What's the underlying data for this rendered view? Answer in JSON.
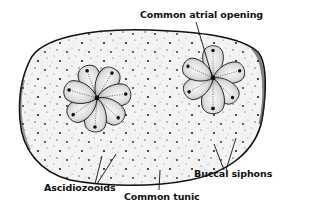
{
  "figure": {
    "labels": {
      "common_atrial_opening": "Common atrial opening",
      "ascidiozooids": "Ascidiozooids",
      "common_tunic": "Common tunic",
      "buccal_siphons": "Buccal siphons"
    },
    "systems": [
      {
        "name": "left-system",
        "center": [
          97,
          98
        ],
        "zooid_count": 7
      },
      {
        "name": "right-system",
        "center": [
          213,
          78
        ],
        "zooid_count": 6
      }
    ],
    "colors": {
      "ink": "#111111",
      "tunic_fill": "#f2f2f2",
      "zooid_fill": "#e6e6e6",
      "zooid_shade": "#9a9a9a",
      "background": "#ffffff"
    }
  }
}
